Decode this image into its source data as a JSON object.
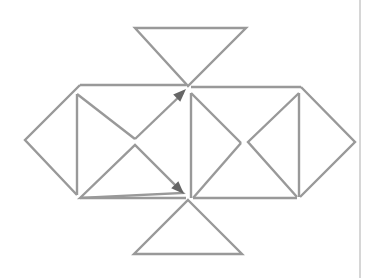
{
  "diagram": {
    "type": "geometric-net",
    "stroke_color": "#999999",
    "arrow_color": "#666666",
    "border_color": "#bbbbbb",
    "stroke_width": 2.4
  },
  "shapes": {
    "top_triangle": [
      [
        135,
        28
      ],
      [
        246,
        28
      ],
      [
        188,
        86
      ]
    ],
    "bottom_triangle": [
      [
        188,
        200
      ],
      [
        242,
        254
      ],
      [
        134,
        254
      ]
    ],
    "left_square_top_edge": [
      [
        80,
        85
      ],
      [
        186,
        85
      ]
    ],
    "left_square_bottom_edge": [
      [
        80,
        198
      ],
      [
        186,
        198
      ]
    ],
    "right_square_top_edge": [
      [
        191,
        87
      ],
      [
        301,
        87
      ]
    ],
    "right_square_bottom_edge": [
      [
        193,
        198
      ],
      [
        297,
        198
      ]
    ],
    "left_diamond": [
      [
        80,
        85
      ],
      [
        25,
        140
      ],
      [
        77,
        195
      ]
    ],
    "left_inner_vertical": [
      [
        77,
        94
      ],
      [
        77,
        195
      ]
    ],
    "left_upper_diag": [
      [
        77,
        94
      ],
      [
        135,
        139
      ]
    ],
    "left_arrow_up": [
      [
        135,
        139
      ],
      [
        183,
        93
      ]
    ],
    "left_lower_triangle": [
      [
        80,
        198
      ],
      [
        135,
        145
      ],
      [
        183,
        193
      ]
    ],
    "right_inner_vertical": [
      [
        191,
        93
      ],
      [
        191,
        198
      ]
    ],
    "right_upper_diag": [
      [
        191,
        93
      ],
      [
        241,
        143
      ]
    ],
    "right_lower_diag": [
      [
        241,
        143
      ],
      [
        193,
        198
      ]
    ],
    "right_mid_triangle": [
      [
        299,
        93
      ],
      [
        248,
        142
      ],
      [
        297,
        197
      ]
    ],
    "right_inner_vertical2": [
      [
        299,
        93
      ],
      [
        299,
        197
      ]
    ],
    "right_diamond": [
      [
        301,
        87
      ],
      [
        355,
        142
      ],
      [
        300,
        197
      ]
    ],
    "page_border_line": [
      [
        360,
        0
      ],
      [
        360,
        278
      ]
    ]
  },
  "arrows": [
    {
      "name": "arrow-up-right",
      "tip": [
        186,
        89
      ],
      "from": [
        135,
        139
      ]
    },
    {
      "name": "arrow-down-right",
      "tip": [
        184,
        194
      ],
      "from": [
        135,
        145
      ]
    }
  ]
}
